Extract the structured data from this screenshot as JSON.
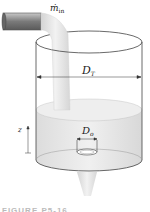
{
  "figure": {
    "inflow_label": "ṁ",
    "inflow_subscript": "in",
    "tank_diameter_label": "D",
    "tank_diameter_subscript": "T",
    "outlet_diameter_label": "D",
    "outlet_diameter_subscript": "o",
    "height_label": "z",
    "caption": "FIGURE P5-16"
  },
  "colors": {
    "tank_outline": "#444444",
    "water": "#e6e6e6",
    "pipe": "#8a8a8a",
    "stream": "#e2e2e2"
  }
}
